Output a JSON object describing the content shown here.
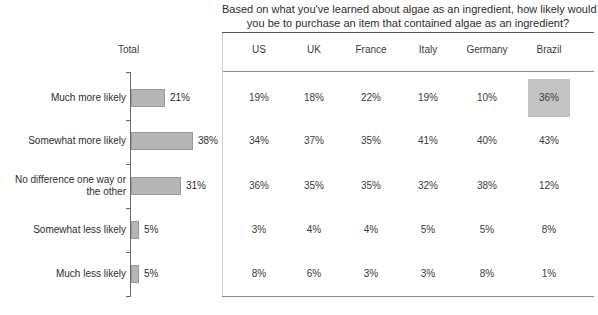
{
  "title": {
    "line1": "Based on what you've learned about algae as an ingredient, how likely would",
    "line2": "you be to purchase an item that contained algae as an ingredient?"
  },
  "chart_data": {
    "type": "bar",
    "orientation": "horizontal",
    "title": "Based on what you've learned about algae as an ingredient, how likely would you be to purchase an item that contained algae as an ingredient?",
    "xlabel": "",
    "ylabel": "",
    "xlim": [
      0,
      45
    ],
    "grid": false,
    "legend": null,
    "total_header": "Total",
    "categories": [
      "Much more likely",
      "Somewhat more likely",
      "No difference one way or the other",
      "Somewhat less likely",
      "Much less likely"
    ],
    "category_lines": [
      [
        "Much more likely"
      ],
      [
        "Somewhat more likely"
      ],
      [
        "No difference one way or",
        "the other"
      ],
      [
        "Somewhat less likely"
      ],
      [
        "Much less likely"
      ]
    ],
    "values": [
      21,
      38,
      31,
      5,
      5
    ],
    "value_labels": [
      "21%",
      "38%",
      "31%",
      "5%",
      "5%"
    ],
    "bar_color": "#b5b5b5",
    "bar_border_color": "#9a9a9a",
    "table": {
      "columns": [
        "US",
        "UK",
        "France",
        "Italy",
        "Germany",
        "Brazil"
      ],
      "rows": [
        {
          "label": "Much more likely",
          "values": [
            "19%",
            "18%",
            "22%",
            "19%",
            "10%",
            "36%"
          ]
        },
        {
          "label": "Somewhat more likely",
          "values": [
            "34%",
            "37%",
            "35%",
            "41%",
            "40%",
            "43%"
          ]
        },
        {
          "label": "No difference one way or the other",
          "values": [
            "36%",
            "35%",
            "35%",
            "32%",
            "38%",
            "12%"
          ]
        },
        {
          "label": "Somewhat less likely",
          "values": [
            "3%",
            "4%",
            "4%",
            "5%",
            "5%",
            "8%"
          ]
        },
        {
          "label": "Much less likely",
          "values": [
            "8%",
            "6%",
            "3%",
            "3%",
            "8%",
            "1%"
          ]
        }
      ],
      "highlight": {
        "row": 0,
        "column": 5,
        "value": "36%",
        "color": "#c3c3c3"
      }
    }
  }
}
